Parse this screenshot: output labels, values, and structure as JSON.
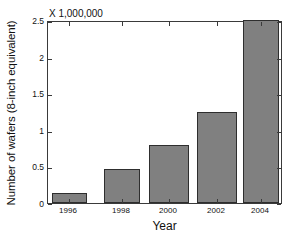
{
  "chart_data": {
    "type": "bar",
    "title": "",
    "subtitle": "",
    "multiplier_label": "X 1,000,000",
    "xlabel": "Year",
    "ylabel": "Number of wafers (8-inch equivalent)",
    "categories": [
      "1996",
      "1998",
      "2000",
      "2002",
      "2004"
    ],
    "values": [
      0.14,
      0.46,
      0.79,
      1.25,
      2.5
    ],
    "series": [
      {
        "name": "Number of wafers (8-inch equivalent)",
        "values": [
          0.14,
          0.46,
          0.79,
          1.25,
          2.5
        ]
      }
    ],
    "ylim": [
      0,
      2.5
    ],
    "ytick_labels": [
      "0",
      "0.5",
      "1",
      "1.5",
      "2",
      "2.5"
    ],
    "ytick_values": [
      0,
      0.5,
      1,
      1.5,
      2,
      2.5
    ],
    "xtick_labels": [
      "1996",
      "1998",
      "2000",
      "2002",
      "2004"
    ],
    "grid": false,
    "legend": "none",
    "bar_color": "#808080",
    "bar_edge_color": "#2e2e2e",
    "axis_color": "#3a3a3a",
    "background_color": "#ffffff"
  }
}
